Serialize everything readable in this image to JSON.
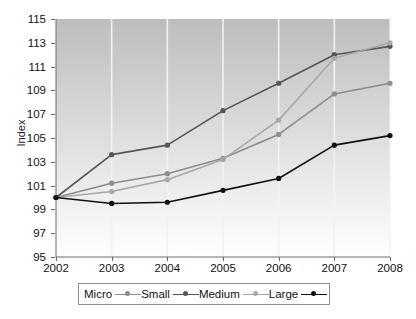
{
  "chart_data": {
    "type": "line",
    "title": "",
    "xlabel": "",
    "ylabel": "Index",
    "x": [
      2002,
      2003,
      2004,
      2005,
      2006,
      2007,
      2008
    ],
    "xtick_labels": [
      "2002",
      "2003",
      "2004",
      "2005",
      "2006",
      "2007",
      "2008"
    ],
    "ytick_labels": [
      "115",
      "113",
      "111",
      "109",
      "107",
      "105",
      "103",
      "101",
      "99",
      "97",
      "95"
    ],
    "yticks": [
      115,
      113,
      111,
      109,
      107,
      105,
      103,
      101,
      99,
      97,
      95
    ],
    "ylim": [
      95,
      115
    ],
    "xlim": [
      2002,
      2008
    ],
    "grid": "vertical-only",
    "legend_position": "bottom",
    "series": [
      {
        "name": "Micro",
        "color": "#8c8c8c",
        "marker": "circle",
        "values": [
          100,
          101.2,
          102.0,
          103.3,
          105.3,
          108.7,
          109.6
        ]
      },
      {
        "name": "Small",
        "color": "#565656",
        "marker": "circle",
        "values": [
          100,
          103.6,
          104.4,
          107.3,
          109.6,
          112.0,
          112.7
        ]
      },
      {
        "name": "Medium",
        "color": "#a8a8a8",
        "marker": "circle",
        "values": [
          100,
          100.5,
          101.5,
          103.2,
          106.5,
          111.7,
          113.0
        ]
      },
      {
        "name": "Large",
        "color": "#111111",
        "marker": "circle",
        "values": [
          100,
          99.5,
          99.6,
          100.6,
          101.6,
          104.4,
          105.2
        ]
      }
    ]
  },
  "colors": {
    "plot_bg_top": "#bdbdbd",
    "plot_bg_bottom": "#ffffff",
    "gridline": "#f2f2f2",
    "axis": "#6d6d6d",
    "text": "#111111",
    "legend_border": "#8e8e8e"
  }
}
